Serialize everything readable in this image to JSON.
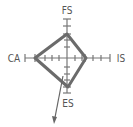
{
  "diagram": {
    "type": "quadrant-radar",
    "axes": {
      "top": "FS",
      "left": "CA",
      "right": "IS",
      "bottom": "ES"
    },
    "colors": {
      "axis": "#666666",
      "shape": "#6b6b6b",
      "label": "#555555",
      "arrow": "#666666"
    }
  }
}
